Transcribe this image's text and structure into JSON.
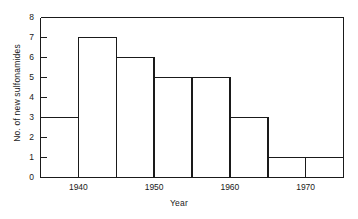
{
  "chart_data": {
    "type": "bar",
    "title": "",
    "xlabel": "Year",
    "ylabel": "No. of new sulfonamides",
    "categories": [
      "1935-1940",
      "1940-1945",
      "1945-1950",
      "1950-1955",
      "1955-1960",
      "1960-1965",
      "1965-1970",
      "1970-1975"
    ],
    "bin_edges": [
      1935,
      1940,
      1945,
      1950,
      1955,
      1960,
      1965,
      1970,
      1975
    ],
    "values": [
      3,
      7,
      6,
      5,
      5,
      3,
      1,
      1
    ],
    "xlim": [
      1935,
      1975
    ],
    "ylim": [
      0,
      8
    ],
    "xticks": [
      1940,
      1950,
      1960,
      1970
    ],
    "xtick_labels": [
      "1940",
      "1950",
      "1960",
      "1970"
    ],
    "xminorticks": [
      1945,
      1955,
      1965
    ],
    "yticks": [
      0,
      1,
      2,
      3,
      4,
      5,
      6,
      7,
      8
    ],
    "ytick_labels": [
      "0",
      "1",
      "2",
      "3",
      "4",
      "5",
      "6",
      "7",
      "8"
    ],
    "grid": false,
    "legend": null,
    "series_color": "#1a1a1a",
    "background_color": "#ffffff"
  }
}
